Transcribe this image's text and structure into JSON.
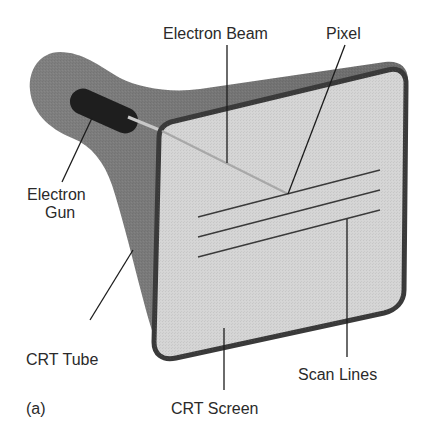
{
  "figure": {
    "panel_label": "(a)",
    "labels": {
      "electron_beam": "Electron Beam",
      "pixel": "Pixel",
      "electron_gun_line1": "Electron",
      "electron_gun_line2": "Gun",
      "crt_tube": "CRT Tube",
      "scan_lines": "Scan Lines",
      "crt_screen": "CRT Screen"
    },
    "colors": {
      "tube": "#7a7a7a",
      "tube_dark": "#5c5c5c",
      "gun": "#1e1e1e",
      "screen": "#d4d4d4",
      "screen_border": "#3c3c3c",
      "beam": "#bdbdbd",
      "text": "#2a2a2a"
    },
    "scan_line_count": 3
  }
}
